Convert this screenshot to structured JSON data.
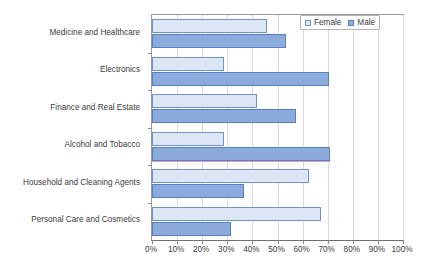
{
  "chart_data": {
    "type": "bar",
    "orientation": "horizontal",
    "title": "",
    "xlabel": "",
    "ylabel": "",
    "xlim": [
      0,
      100
    ],
    "x_tick_labels": [
      "0%",
      "10%",
      "20%",
      "30%",
      "40%",
      "50%",
      "60%",
      "70%",
      "80%",
      "90%",
      "100%"
    ],
    "x_tick_values": [
      0,
      10,
      20,
      30,
      40,
      50,
      60,
      70,
      80,
      90,
      100
    ],
    "grid": "vertical",
    "legend_position": "top-right",
    "categories": [
      "Medicine and Healthcare",
      "Electronics",
      "Finance and Real Estate",
      "Alcohol and Tobacco",
      "Household and Cleaning Agents",
      "Personal Care and Cosmetics"
    ],
    "series": [
      {
        "name": "Female",
        "color": "#dce6f4",
        "border_color": "#6f93c7",
        "values": [
          46,
          28.5,
          42,
          28.5,
          62.5,
          67.5
        ]
      },
      {
        "name": "Male",
        "color": "#8cabdd",
        "border_color": "#5680bf",
        "values": [
          53.5,
          70.5,
          57.5,
          70.8,
          36.5,
          31.5
        ]
      }
    ]
  },
  "legend": {
    "items": [
      {
        "label": "Female",
        "swatch": "legend-swatch-female"
      },
      {
        "label": "Male",
        "swatch": "legend-swatch-male"
      }
    ]
  },
  "colors": {
    "female_fill": "#dce6f4",
    "female_stroke": "#6f93c7",
    "male_fill": "#8cabdd",
    "male_stroke": "#5680bf",
    "gridline": "#d9d9d9",
    "axis": "#9a9a9a",
    "text": "#3b3b3b",
    "accent_underline": "#e59bc4"
  }
}
